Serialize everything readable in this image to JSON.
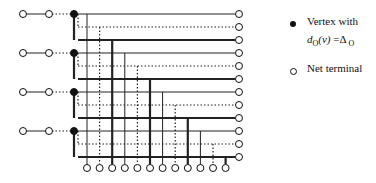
{
  "diagram": {
    "rows": 12,
    "row_y_start": 14,
    "row_spacing": 13,
    "row_styles": [
      "thin",
      "dotted",
      "thick"
    ],
    "columns": 12,
    "col_x_start": 87,
    "col_spacing": 12.6,
    "right_terminal_x": 239,
    "bottom_terminal_y": 168,
    "vertex_x": 74,
    "left_terminal_x": [
      23,
      49
    ],
    "groups": 4,
    "colors": {
      "line": "#222222",
      "vertex": "#111111",
      "terminal_fill": "#ffffff"
    }
  },
  "legend": {
    "items": [
      {
        "marker": "filled-vertex",
        "label": "Vertex with",
        "formula": {
          "d": "d",
          "d_sub": "O",
          "v": "(v)",
          "eq": " =Δ",
          "delta_sub": " O"
        }
      },
      {
        "marker": "net-terminal",
        "label": "Net terminal"
      }
    ]
  }
}
